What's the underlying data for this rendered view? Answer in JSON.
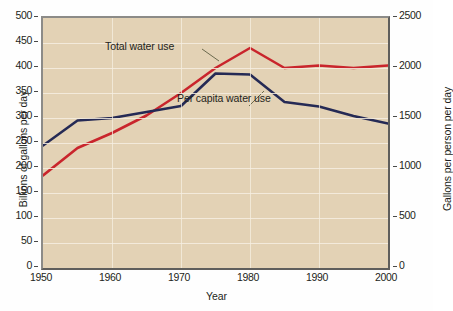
{
  "chart_data": {
    "type": "line",
    "title": "",
    "xlabel": "Year",
    "ylabel": "Billions of gallons per day",
    "ylabel_right": "Gallons per person per day",
    "xlim": [
      1950,
      2000
    ],
    "ylim": [
      0,
      500
    ],
    "ylim_right": [
      0,
      2500
    ],
    "grid": true,
    "legend_position": "inline-annotations",
    "x_ticks": [
      "1950",
      "1960",
      "1970",
      "1980",
      "1990",
      "2000"
    ],
    "x_tick_values": [
      1950,
      1960,
      1970,
      1980,
      1990,
      2000
    ],
    "y_ticks_left": [
      "0",
      "50",
      "100",
      "150",
      "200",
      "250",
      "300",
      "350",
      "400",
      "450",
      "500"
    ],
    "y_tick_values_left": [
      0,
      50,
      100,
      150,
      200,
      250,
      300,
      350,
      400,
      450,
      500
    ],
    "y_ticks_right": [
      "0",
      "500",
      "1000",
      "1500",
      "2000",
      "2500"
    ],
    "y_tick_values_right": [
      0,
      500,
      1000,
      1500,
      2000,
      2500
    ],
    "series": [
      {
        "name": "Total water use",
        "axis": "left",
        "color": "#c9252c",
        "unit": "billions of gallons per day",
        "x": [
          1950,
          1955,
          1960,
          1965,
          1970,
          1975,
          1980,
          1985,
          1990,
          1995,
          2000
        ],
        "values": [
          185,
          240,
          270,
          305,
          350,
          400,
          440,
          400,
          405,
          400,
          405
        ]
      },
      {
        "name": "Per capita water use",
        "axis": "right",
        "color": "#252a55",
        "unit": "gallons per person per day",
        "x": [
          1950,
          1955,
          1960,
          1965,
          1970,
          1975,
          1980,
          1985,
          1990,
          1995,
          2000
        ],
        "values": [
          1225,
          1475,
          1500,
          1560,
          1620,
          1945,
          1935,
          1660,
          1615,
          1520,
          1445
        ],
        "values_left_scale": [
          245,
          295,
          300,
          312,
          324,
          389,
          387,
          332,
          323,
          304,
          289
        ]
      }
    ],
    "annotations": [
      {
        "id": "annot-total",
        "text": "Total water use"
      },
      {
        "id": "annot-percap",
        "text": "Per capita water use"
      }
    ]
  },
  "axes": {
    "x_title": "Year",
    "y_title_left": "Billions of gallons per day",
    "y_title_right": "Gallons per person per day"
  },
  "caption": {
    "text": ""
  },
  "colors": {
    "plot_background": "#e3d2b5",
    "total_line": "#c9252c",
    "percapita_line": "#252a55",
    "gridline": "#f6efe2",
    "frame": "#7c7b78"
  }
}
